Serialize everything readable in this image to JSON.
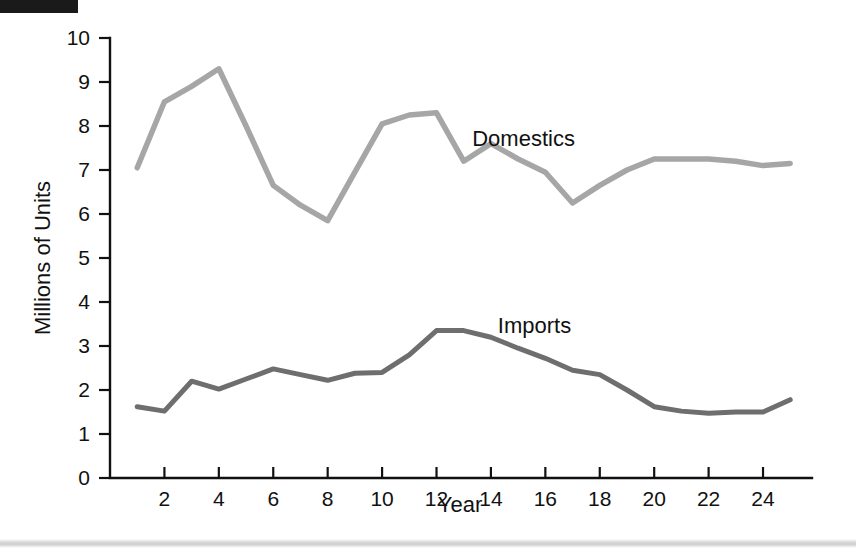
{
  "page": {
    "background_color": "#ffffff",
    "corner_mark_color": "#1a1a1a",
    "bottom_rule_color": "#d4d4d4"
  },
  "chart_data": {
    "type": "line",
    "title": "",
    "xlabel": "Year",
    "ylabel": "Millions of Units",
    "xlim": [
      0,
      25.8
    ],
    "ylim": [
      0,
      10
    ],
    "grid": false,
    "legend": "inline-labels",
    "x_ticks": [
      2,
      4,
      6,
      8,
      10,
      12,
      14,
      16,
      18,
      20,
      22,
      24
    ],
    "x_tick_labels": [
      "2",
      "4",
      "6",
      "8",
      "10",
      "12",
      "14",
      "16",
      "18",
      "20",
      "22",
      "24"
    ],
    "y_ticks": [
      0,
      1,
      2,
      3,
      4,
      5,
      6,
      7,
      8,
      9,
      10
    ],
    "y_tick_labels": [
      "0",
      "1",
      "2",
      "3",
      "4",
      "5",
      "6",
      "7",
      "8",
      "9",
      "10"
    ],
    "x": [
      1,
      2,
      3,
      4,
      5,
      6,
      7,
      8,
      9,
      10,
      11,
      12,
      13,
      14,
      15,
      16,
      17,
      18,
      19,
      20,
      21,
      22,
      23,
      24,
      25
    ],
    "series": [
      {
        "name": "Domestics",
        "color": "#a6a6a6",
        "stroke_width": 5.5,
        "label_x": 15.2,
        "label_y": 7.55,
        "values": [
          7.05,
          8.55,
          8.9,
          9.3,
          8.0,
          6.65,
          6.2,
          5.85,
          6.95,
          8.05,
          8.25,
          8.3,
          7.2,
          7.6,
          7.25,
          6.95,
          6.25,
          6.65,
          7.0,
          7.25,
          7.25,
          7.25,
          7.2,
          7.1,
          7.15
        ]
      },
      {
        "name": "Imports",
        "color": "#6e6e6e",
        "stroke_width": 5.0,
        "label_x": 15.6,
        "label_y": 3.3,
        "values": [
          1.62,
          1.52,
          2.2,
          2.02,
          2.25,
          2.48,
          2.35,
          2.22,
          2.38,
          2.4,
          2.8,
          3.35,
          3.35,
          3.2,
          2.95,
          2.72,
          2.45,
          2.35,
          2.0,
          1.62,
          1.52,
          1.47,
          1.5,
          1.5,
          1.78
        ]
      }
    ]
  }
}
